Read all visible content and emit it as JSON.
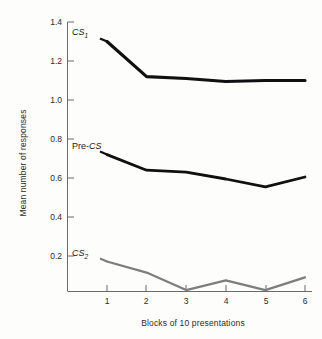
{
  "chart_data": {
    "type": "line",
    "title": "",
    "xlabel": "Blocks of 10 presentations",
    "ylabel": "Mean number of responses",
    "x": [
      1,
      2,
      3,
      4,
      5,
      6
    ],
    "categories": [
      "1",
      "2",
      "3",
      "4",
      "5",
      "6"
    ],
    "xlim": [
      0.45,
      6.3
    ],
    "ylim": [
      0.02,
      1.45
    ],
    "ytick_labels": [
      "0.2",
      "0.4",
      "0.6",
      "0.8",
      "1.0",
      "1.2",
      "1.4"
    ],
    "ytick_values": [
      0.2,
      0.4,
      0.6,
      0.8,
      1.0,
      1.2,
      1.4
    ],
    "xtick_labels": [
      "1",
      "2",
      "3",
      "4",
      "5",
      "6"
    ],
    "grid": false,
    "legend_position": "inline-annotations",
    "series": [
      {
        "name": "CS1",
        "label_text": "CS",
        "label_sub": "1",
        "color": "#101010",
        "width": 3.2,
        "values": [
          1.3,
          1.12,
          1.11,
          1.095,
          1.1,
          1.1
        ]
      },
      {
        "name": "Pre-CS",
        "label_prefix": "Pre-",
        "label_text": "CS",
        "label_sub": "",
        "color": "#101010",
        "width": 2.8,
        "values": [
          0.72,
          0.64,
          0.63,
          0.595,
          0.555,
          0.605
        ]
      },
      {
        "name": "CS2",
        "label_text": "CS",
        "label_sub": "2",
        "color": "#7d7d7d",
        "width": 2.2,
        "values": [
          0.172,
          0.115,
          0.025,
          0.075,
          0.025,
          0.09
        ]
      }
    ],
    "annotations": [
      {
        "name": "cs1-label",
        "text": "CS",
        "sub": "1"
      },
      {
        "name": "precs-label",
        "text": "Pre-CS",
        "sub": ""
      },
      {
        "name": "cs2-label",
        "text": "CS",
        "sub": "2"
      }
    ],
    "axis_color": "#555555"
  }
}
